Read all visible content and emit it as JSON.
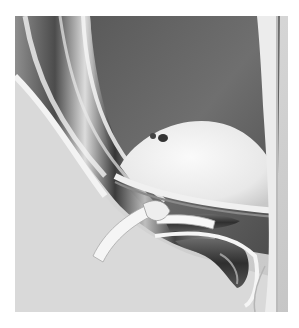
{
  "image": {
    "description": "Grayscale pencil-style medical illustration of a surgical anatomical view with retracted tissue layers, a white ribbon-like tie/sling, and dark tubular vessels emerging from an opening",
    "palette": {
      "background": "#ffffff",
      "skin_light": "#e2e2e2",
      "skin_mid": "#c9c9c9",
      "cavity_dark": "#4a4a4a",
      "cavity_mid": "#6e6e6e",
      "vessel_dark": "#3a3a3a",
      "ribbon_white": "#f4f4f4",
      "dome_white": "#efefef",
      "rim_light": "#f0f0f0"
    },
    "elements": [
      {
        "name": "left-tissue-folds",
        "tone": "dark-banded"
      },
      {
        "name": "inner-cavity",
        "tone": "dark"
      },
      {
        "name": "central-dome",
        "tone": "white"
      },
      {
        "name": "white-ribbon-sling",
        "tone": "white"
      },
      {
        "name": "vessel-upper",
        "tone": "dark"
      },
      {
        "name": "vessel-lower-loop",
        "tone": "dark"
      },
      {
        "name": "right-rim",
        "tone": "light"
      },
      {
        "name": "lower-skin-surface",
        "tone": "light-gray"
      }
    ]
  }
}
